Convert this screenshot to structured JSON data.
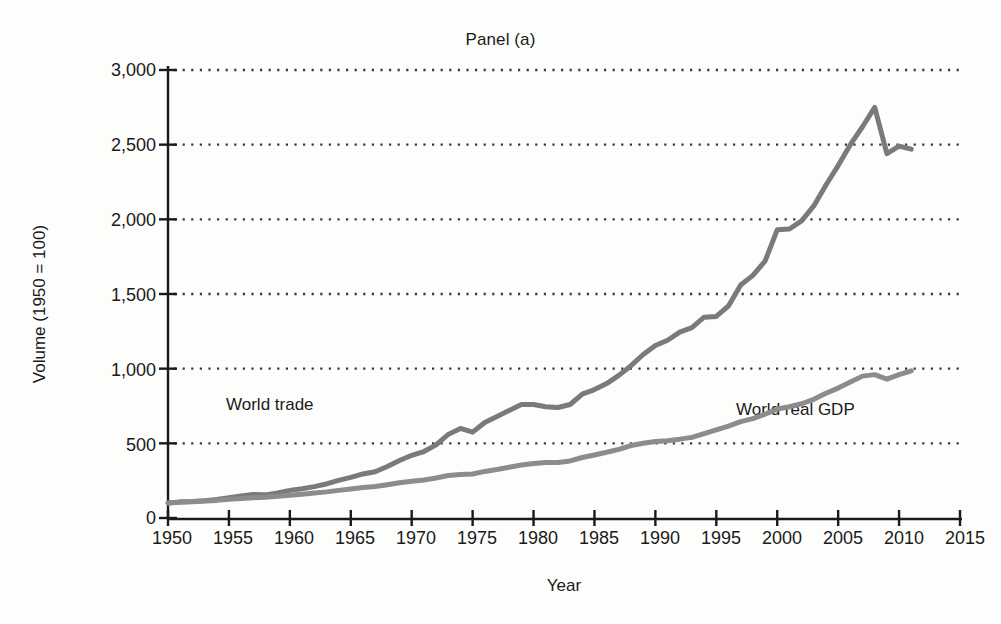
{
  "figure": {
    "title": "Panel (a)",
    "background_color": "#fdfdfc",
    "text_color": "#1a1a1a"
  },
  "axes": {
    "x_title": "Year",
    "y_title": "Volume (1950 = 100)",
    "axis_color": "#1a1a1a",
    "gridline_color": "#3a3a3a"
  },
  "labels": {
    "world_trade": "World trade",
    "world_real_gdp": "World real GDP"
  },
  "ticks": {
    "y": [
      "0",
      "500",
      "1,000",
      "1,500",
      "2,000",
      "2,500",
      "3,000"
    ],
    "x": [
      "1950",
      "1955",
      "1960",
      "1965",
      "1970",
      "1975",
      "1980",
      "1985",
      "1990",
      "1995",
      "2000",
      "2005",
      "2010",
      "2015"
    ]
  },
  "chart_data": {
    "type": "line",
    "title": "Panel (a)",
    "xlabel": "Year",
    "ylabel": "Volume (1950 = 100)",
    "xlim": [
      1950,
      2015
    ],
    "ylim": [
      0,
      3000
    ],
    "xticks": [
      1950,
      1955,
      1960,
      1965,
      1970,
      1975,
      1980,
      1985,
      1990,
      1995,
      2000,
      2005,
      2010,
      2015
    ],
    "yticks": [
      0,
      500,
      1000,
      1500,
      2000,
      2500,
      3000
    ],
    "grid": "horizontal-dotted",
    "legend_position": "inline-annotations",
    "line_color_trade": "#7a7a7a",
    "line_color_gdp": "#8c8c8c",
    "line_width": 5,
    "series": [
      {
        "name": "World trade",
        "color": "#7a7a7a",
        "x": [
          1950,
          1951,
          1952,
          1953,
          1954,
          1955,
          1956,
          1957,
          1958,
          1959,
          1960,
          1961,
          1962,
          1963,
          1964,
          1965,
          1966,
          1967,
          1968,
          1969,
          1970,
          1971,
          1972,
          1973,
          1974,
          1975,
          1976,
          1977,
          1978,
          1979,
          1980,
          1981,
          1982,
          1983,
          1984,
          1985,
          1986,
          1987,
          1988,
          1989,
          1990,
          1991,
          1992,
          1993,
          1994,
          1995,
          1996,
          1997,
          1998,
          1999,
          2000,
          2001,
          2002,
          2003,
          2004,
          2005,
          2006,
          2007,
          2008,
          2009,
          2010,
          2011
        ],
        "values": [
          100,
          108,
          110,
          116,
          124,
          135,
          148,
          158,
          155,
          168,
          185,
          196,
          210,
          228,
          252,
          272,
          295,
          310,
          345,
          385,
          420,
          445,
          490,
          560,
          600,
          575,
          640,
          680,
          720,
          760,
          760,
          745,
          740,
          760,
          830,
          860,
          900,
          955,
          1020,
          1095,
          1155,
          1190,
          1245,
          1275,
          1345,
          1350,
          1420,
          1560,
          1625,
          1720,
          1930,
          1935,
          1990,
          2090,
          2230,
          2360,
          2500,
          2620,
          2750,
          2440,
          2490,
          2470
        ]
      },
      {
        "name": "World real GDP",
        "color": "#8c8c8c",
        "x": [
          1950,
          1951,
          1952,
          1953,
          1954,
          1955,
          1956,
          1957,
          1958,
          1959,
          1960,
          1961,
          1962,
          1963,
          1964,
          1965,
          1966,
          1967,
          1968,
          1969,
          1970,
          1971,
          1972,
          1973,
          1974,
          1975,
          1976,
          1977,
          1978,
          1979,
          1980,
          1981,
          1982,
          1983,
          1984,
          1985,
          1986,
          1987,
          1988,
          1989,
          1990,
          1991,
          1992,
          1993,
          1994,
          1995,
          1996,
          1997,
          1998,
          1999,
          2000,
          2001,
          2002,
          2003,
          2004,
          2005,
          2006,
          2007,
          2008,
          2009,
          2010,
          2011
        ],
        "values": [
          100,
          105,
          109,
          114,
          118,
          125,
          131,
          136,
          139,
          146,
          153,
          159,
          167,
          175,
          185,
          194,
          204,
          211,
          223,
          236,
          246,
          255,
          268,
          285,
          292,
          295,
          312,
          325,
          340,
          355,
          365,
          372,
          372,
          382,
          405,
          422,
          440,
          460,
          485,
          500,
          512,
          518,
          528,
          540,
          565,
          590,
          615,
          645,
          665,
          695,
          730,
          745,
          765,
          795,
          835,
          870,
          910,
          950,
          960,
          930,
          960,
          985
        ]
      }
    ]
  }
}
